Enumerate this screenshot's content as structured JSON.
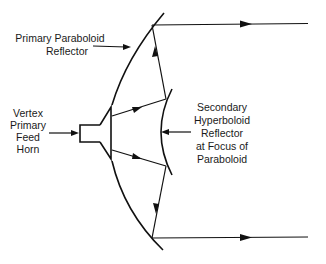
{
  "diagram": {
    "labels": {
      "primary": [
        "Primary Paraboloid",
        "Reflector"
      ],
      "feed": [
        "Vertex",
        "Primary",
        "Feed",
        "Horn"
      ],
      "secondary": [
        "Secondary",
        "Hyperboloid",
        "Reflector",
        "at Focus of",
        "Paraboloid"
      ]
    },
    "components": [
      {
        "id": "primary-reflector",
        "name": "Primary Paraboloid Reflector"
      },
      {
        "id": "feed-horn",
        "name": "Vertex Primary Feed Horn"
      },
      {
        "id": "secondary-reflector",
        "name": "Secondary Hyperboloid Reflector at Focus of Paraboloid"
      }
    ],
    "colors": {
      "ink": "#111111",
      "background": "#ffffff"
    }
  }
}
